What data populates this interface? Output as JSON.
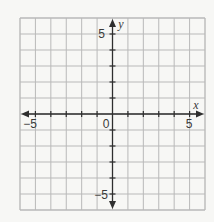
{
  "chart_data": {
    "type": "scatter",
    "title": "",
    "xlabel": "x",
    "ylabel": "y",
    "xlim": [
      -6,
      6
    ],
    "ylim": [
      -6,
      6
    ],
    "grid": true,
    "grid_step": 1,
    "x_tick_labels": [
      {
        "value": -5,
        "label": "−5"
      },
      {
        "value": 0,
        "label": "0"
      },
      {
        "value": 5,
        "label": "5"
      }
    ],
    "y_tick_labels": [
      {
        "value": 5,
        "label": "5"
      },
      {
        "value": -5,
        "label": "−5"
      }
    ],
    "series": [],
    "legend": null
  },
  "labels": {
    "x_axis_name": "x",
    "y_axis_name": "y",
    "x_neg5": "−5",
    "origin": "0",
    "x_pos5": "5",
    "y_pos5": "5",
    "y_neg5": "−5"
  },
  "colors": {
    "grid": "#b9b9b9",
    "axis": "#2e2e2e",
    "background": "#f7f7f5"
  }
}
